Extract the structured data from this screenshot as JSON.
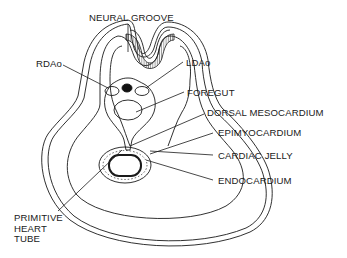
{
  "diagram": {
    "colors": {
      "line": "#1a1a1a",
      "background": "#ffffff"
    },
    "labels": {
      "neural_groove": "NEURAL GROOVE",
      "rdao": "RDAo",
      "ldao": "LDAo",
      "foregut": "FOREGUT",
      "dorsal_mesocardium": "DORSAL MESOCARDIUM",
      "epimyocardium": "EPIMYOCARDIUM",
      "cardiac_jelly": "CARDIAC JELLY",
      "endocardium": "ENDOCARDIUM",
      "primitive_heart_tube": "PRIMITIVE\nHEART\nTUBE"
    }
  }
}
